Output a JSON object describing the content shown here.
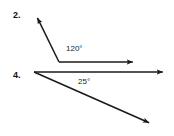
{
  "page": {
    "background_color": "#ffffff",
    "stroke_color": "#1a1a1a",
    "width": 174,
    "height": 136
  },
  "figures": [
    {
      "number_label": "2.",
      "angle_label": "120°",
      "angle_value": 120,
      "vertex": {
        "x": 59,
        "y": 62
      },
      "rays": [
        {
          "name": "horizontal-right-ray",
          "tip": {
            "x": 136,
            "y": 62
          },
          "arrow": true
        },
        {
          "name": "upper-left-ray",
          "tip": {
            "x": 36,
            "y": 15
          },
          "arrow": true
        }
      ]
    },
    {
      "number_label": "4.",
      "angle_label": "25°",
      "angle_value": 25,
      "vertex": {
        "x": 34,
        "y": 72
      },
      "rays": [
        {
          "name": "horizontal-right-ray",
          "tip": {
            "x": 166,
            "y": 72
          },
          "arrow": true
        },
        {
          "name": "lower-right-ray",
          "tip": {
            "x": 152,
            "y": 124
          },
          "arrow": true
        }
      ]
    }
  ]
}
